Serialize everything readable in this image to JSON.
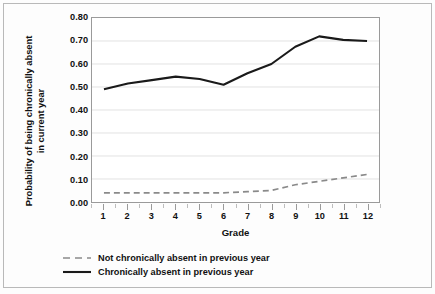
{
  "chart_data": {
    "type": "line",
    "title": "",
    "xlabel": "Grade",
    "ylabel": "Probability of being chronically absent in current year",
    "ylabel_line1": "Probability of being chronically absent",
    "ylabel_line2": "in current year",
    "x": [
      1,
      2,
      3,
      4,
      5,
      6,
      7,
      8,
      9,
      10,
      11,
      12
    ],
    "categories": [
      "1",
      "2",
      "3",
      "4",
      "5",
      "6",
      "7",
      "8",
      "9",
      "10",
      "11",
      "12"
    ],
    "xlim": [
      0.5,
      12.5
    ],
    "ylim": [
      0.0,
      0.8
    ],
    "yticks": [
      0.0,
      0.1,
      0.2,
      0.3,
      0.4,
      0.5,
      0.6,
      0.7,
      0.8
    ],
    "ytick_labels": [
      "0.00",
      "0.10",
      "0.20",
      "0.30",
      "0.40",
      "0.50",
      "0.60",
      "0.70",
      "0.80"
    ],
    "grid": "horizontal",
    "legend_position": "below-left",
    "series": [
      {
        "name": "Not chronically absent in previous year",
        "style": "dashed",
        "color": "#8a8a8a",
        "values": [
          0.04,
          0.04,
          0.04,
          0.04,
          0.04,
          0.04,
          0.045,
          0.05,
          0.075,
          0.09,
          0.105,
          0.12
        ]
      },
      {
        "name": "Chronically absent in previous year",
        "style": "solid",
        "color": "#1a1a1a",
        "values": [
          0.49,
          0.515,
          0.53,
          0.545,
          0.535,
          0.51,
          0.56,
          0.6,
          0.675,
          0.72,
          0.705,
          0.7
        ]
      }
    ]
  },
  "legend": {
    "items": [
      {
        "label": "Not chronically absent in previous year",
        "style": "dashed"
      },
      {
        "label": "Chronically absent in previous year",
        "style": "solid"
      }
    ]
  },
  "colors": {
    "series_dashed": "#8a8a8a",
    "series_solid": "#1a1a1a",
    "gridline": "#e2e2e2",
    "axis": "#9a9a9a",
    "frame": "#b9b9b9",
    "plot_background": "#ffffff",
    "figure_background": "#fdfdfd"
  }
}
